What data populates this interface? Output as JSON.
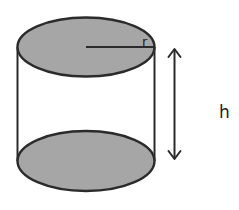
{
  "diagram": {
    "labels": {
      "radius": "r",
      "height": "h"
    },
    "colors": {
      "base_fill": "#a6a6a6",
      "stroke": "#2b2b2b",
      "background": "#ffffff"
    }
  }
}
